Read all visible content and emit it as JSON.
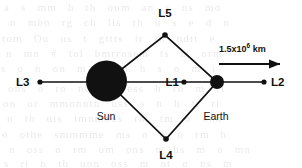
{
  "figure": {
    "bodies": [
      {
        "id": "sun",
        "label": "Sun",
        "cx": 106.5,
        "cy": 81,
        "r": 20.5
      },
      {
        "id": "earth",
        "label": "Earth",
        "cx": 217,
        "cy": 82,
        "r": 7
      }
    ],
    "lagrange_points": [
      {
        "id": "L3",
        "label": "L3",
        "x": 40,
        "y": 82,
        "label_x": 16,
        "label_y": 86,
        "anchor": "start",
        "dot_r": 2.6
      },
      {
        "id": "L1",
        "label": "L1",
        "x": 184,
        "y": 82,
        "label_x": 179,
        "label_y": 86,
        "anchor": "end",
        "dot_r": 2.6
      },
      {
        "id": "L2",
        "label": "L2",
        "x": 264,
        "y": 82,
        "label_x": 271,
        "label_y": 86,
        "anchor": "start",
        "dot_r": 2.6
      },
      {
        "id": "L5",
        "label": "L5",
        "x": 165,
        "y": 35,
        "label_x": 165,
        "label_y": 17,
        "anchor": "middle",
        "dot_r": 2.8
      },
      {
        "id": "L4",
        "label": "L4",
        "x": 166,
        "y": 139,
        "label_x": 166,
        "label_y": 159,
        "anchor": "middle",
        "dot_r": 2.8
      }
    ],
    "body_labels": [
      {
        "id": "sun-label",
        "text": "Sun",
        "x": 106,
        "y": 120
      },
      {
        "id": "earth-label",
        "text": "Earth",
        "x": 216,
        "y": 120
      }
    ],
    "distance_annotation": {
      "text_main": "1.5x10",
      "text_exponent": "6",
      "text_unit": " km",
      "full_text": "1.5x10^6 km",
      "text_x": 219,
      "text_y": 52,
      "arrow_x1": 219,
      "arrow_x2": 283,
      "arrow_y": 64
    },
    "axis_line": {
      "x1": 40,
      "x2": 264,
      "y": 82
    },
    "diamond_path": "M 106.5 81 L 165 35 L 217 82 L 166 139 Z",
    "colors": {
      "ink": "#111111",
      "background": "#ffffff",
      "bleed_text": "#5a5a5a"
    }
  },
  "background_bleed": {
    "note": "faint show-through text from reverse of scanned page",
    "lines": [
      {
        "text": "a  s  mm  h  th  onm  an  s  ns  mo",
        "x": 4,
        "y": 1
      },
      {
        "text": "n  mbo  rg  ch   lis  th  u  s e  d  n",
        "x": 10,
        "y": 16
      },
      {
        "text": "tom    Ou  us  t  gttts  ir  th    ndtt  e",
        "x": 2,
        "y": 32
      },
      {
        "text": "n  mn     # tol bmrrosem   ts   m   orm",
        "x": 6,
        "y": 47
      },
      {
        "text": "s  o  n  on   m  d  nn    h  s  o    m  i",
        "x": 1,
        "y": 62
      },
      {
        "text": "ons  o   ro  nt  nm   ess  h  ro  m  rl",
        "x": 8,
        "y": 82
      },
      {
        "text": "on  or    mmonntn  uss   s  n  h  tt  ri",
        "x": 3,
        "y": 97
      },
      {
        "text": "n  th    uis  imnmoos   rm   tm  o  onn",
        "x": 7,
        "y": 112
      },
      {
        "text": "o    othe  smmmme  ms  o  n   o  rm  h",
        "x": 2,
        "y": 128
      },
      {
        "text": "n  oss  o  rm  om  ons  n  hs  m  o  mn",
        "x": 9,
        "y": 143
      },
      {
        "text": "s  rt  n   th  unn  oss  m   nt  o  ns  m",
        "x": 4,
        "y": 157
      }
    ]
  }
}
